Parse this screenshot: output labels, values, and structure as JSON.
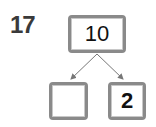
{
  "problem": {
    "number": "17",
    "number_bond": {
      "whole": "10",
      "parts": [
        "",
        "2"
      ]
    }
  },
  "colors": {
    "box_border": "#8a8a8a",
    "arrow": "#777777",
    "text": "#111111"
  }
}
